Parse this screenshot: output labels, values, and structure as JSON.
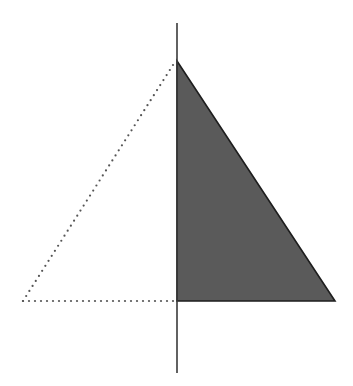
{
  "diagram": {
    "canvas": {
      "width": 353,
      "height": 386
    },
    "colors": {
      "background": "#ffffff",
      "fill": "#5a5a5a",
      "stroke": "#1e1e1e",
      "axis": "#3a3a3a",
      "dotted": "#555555"
    },
    "axis": {
      "x": 177,
      "y1": 23,
      "y2": 373,
      "stroke_width": 1.6
    },
    "filled_triangle": {
      "label": "right half (shaded)",
      "points": [
        [
          177,
          61
        ],
        [
          335,
          301
        ],
        [
          177,
          301
        ]
      ],
      "stroke_width": 1.6
    },
    "dotted_triangle": {
      "label": "left half (mirror, dotted outline)",
      "points": [
        [
          177,
          61
        ],
        [
          23,
          301
        ],
        [
          177,
          301
        ]
      ],
      "dot_radius": 1.1,
      "dot_spacing": 6
    }
  }
}
